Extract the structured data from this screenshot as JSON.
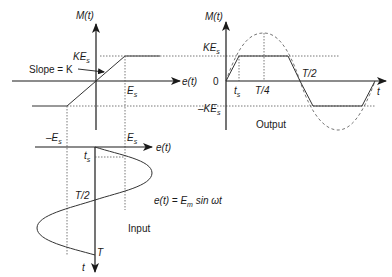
{
  "transfer_plot": {
    "y_axis_label": "M(t)",
    "x_axis_label": "e(t)",
    "ke_label": "KE",
    "ke_sub": "s",
    "es_label": "E",
    "es_sub": "s",
    "slope_label": "Slope = K"
  },
  "output_plot": {
    "y_axis_label": "M(t)",
    "x_axis_label": "t",
    "ke_label": "KE",
    "ke_sub": "s",
    "neg_ke_label": "–KE",
    "neg_ke_sub": "s",
    "zero_label": "0",
    "ts_label": "t",
    "ts_sub": "s",
    "quarter_label": "T/4",
    "half_label": "T/2",
    "caption": "Output"
  },
  "input_plot": {
    "x_axis_label": "e(t)",
    "t_axis_label": "t",
    "neg_es_label": "–E",
    "neg_es_sub": "s",
    "es_label": "E",
    "es_sub": "s",
    "ts_label": "t",
    "ts_sub": "s",
    "half_label": "T/2",
    "period_label": "T",
    "equation_lhs": "e(t) = E",
    "equation_sub": "m",
    "equation_rhs": " sin ωt",
    "caption": "Input"
  }
}
